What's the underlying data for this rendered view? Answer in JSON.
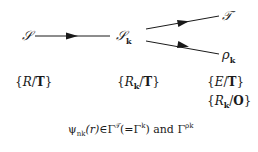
{
  "diagram": {
    "nodes": [
      {
        "id": "S",
        "symbol": "𝒮",
        "sub": ""
      },
      {
        "id": "Sk",
        "symbol": "𝒮",
        "sub": "k"
      },
      {
        "id": "T",
        "symbol": "𝒯",
        "sub": ""
      },
      {
        "id": "rhok",
        "symbol": "ρ",
        "sub": "k"
      }
    ],
    "edges": [
      {
        "from": "S",
        "to": "Sk"
      },
      {
        "from": "Sk",
        "to": "T"
      },
      {
        "from": "Sk",
        "to": "rhok"
      }
    ],
    "labels": {
      "S": {
        "open": "{",
        "var": "R",
        "sub": "",
        "sep": "/",
        "group": "T",
        "close": "}"
      },
      "Sk": {
        "open": "{",
        "var": "R",
        "sub": "k",
        "sep": "/",
        "group": "T",
        "close": "}"
      },
      "T": {
        "open": "{",
        "var": "E",
        "sub": "",
        "sep": "/",
        "group": "T",
        "close": "}"
      },
      "rhok": {
        "open": "{",
        "var": "R",
        "sub": "k",
        "sep": "/",
        "group": "O",
        "close": "}"
      }
    },
    "equation": {
      "psi": "ψ",
      "psi_sub": "nk",
      "arg": "(r)",
      "in": "∈",
      "gamma1": "Γ",
      "gamma1_sup": "𝒯",
      "paren": "(=",
      "gamma2": "Γ",
      "gamma2_sup": "k",
      "close": ")",
      "and": " and ",
      "gamma3": "Γ",
      "gamma3_sup": "ρk"
    },
    "line_color": "#1a1a1a"
  }
}
